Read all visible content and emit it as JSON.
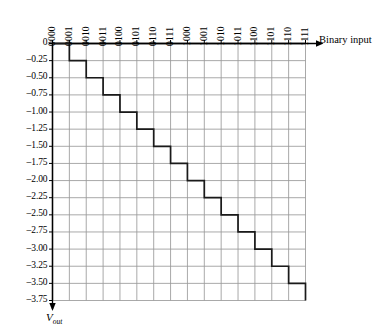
{
  "figure": {
    "x_axis_label": "Binary input",
    "y_axis_label_main": "V",
    "y_axis_label_sub": "out"
  },
  "chart_data": {
    "type": "line",
    "title": "",
    "xlabel": "Binary input",
    "ylabel": "V_out",
    "categories": [
      "0000",
      "0001",
      "0010",
      "0011",
      "0100",
      "0101",
      "0110",
      "0111",
      "1000",
      "1001",
      "1010",
      "1011",
      "1100",
      "1101",
      "1110",
      "1111"
    ],
    "values": [
      0,
      -0.25,
      -0.5,
      -0.75,
      -1.0,
      -1.25,
      -1.5,
      -1.75,
      -2.0,
      -2.25,
      -2.5,
      -2.75,
      -3.0,
      -3.25,
      -3.5,
      -3.75
    ],
    "y_ticks": [
      "0",
      "-0.25",
      "-0.50",
      "-0.75",
      "-1.00",
      "-1.25",
      "-1.50",
      "-1.75",
      "-2.00",
      "-2.25",
      "-2.50",
      "-2.75",
      "-3.00",
      "-3.25",
      "-3.50",
      "-3.75"
    ],
    "y_tick_values": [
      0,
      -0.25,
      -0.5,
      -0.75,
      -1.0,
      -1.25,
      -1.5,
      -1.75,
      -2.0,
      -2.25,
      -2.5,
      -2.75,
      -3.0,
      -3.25,
      -3.5,
      -3.75
    ],
    "ylim": [
      -3.75,
      0
    ],
    "grid": true,
    "step_style": "staircase",
    "legend": "none",
    "line_color": "#1a1a1a",
    "grid_color": "#9a9a9a",
    "axis_color": "#000000"
  }
}
